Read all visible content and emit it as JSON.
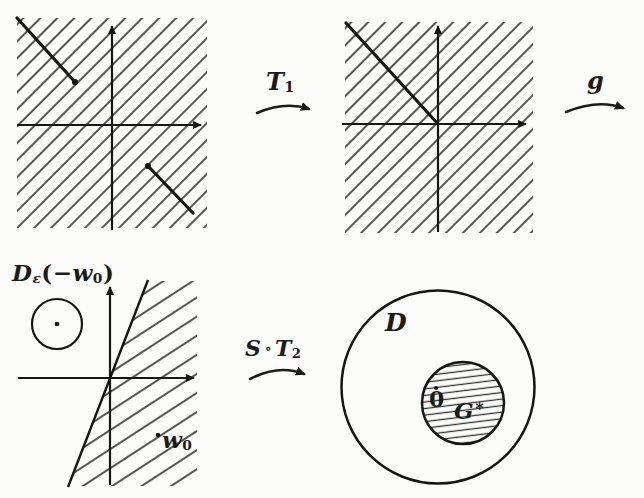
{
  "labels": {
    "t1": {
      "base": "T",
      "sub": "1"
    },
    "g": {
      "base": "g"
    },
    "st2": {
      "s": "S",
      "comp": "∘",
      "base": "T",
      "sub": "2"
    },
    "d_eps": {
      "base": "D",
      "sub": "ε",
      "open": "(−",
      "w": "w",
      "wsub": "0",
      "close": ")"
    },
    "w0": {
      "base": "w",
      "sub": "0"
    },
    "domain_d": {
      "base": "D"
    },
    "zero": {
      "base": "0"
    },
    "g_star": {
      "base": "G",
      "star": "*"
    }
  },
  "colors": {
    "ink": "#1b1b1b",
    "hatch": "#383838",
    "paper": "#fcfcfa"
  }
}
